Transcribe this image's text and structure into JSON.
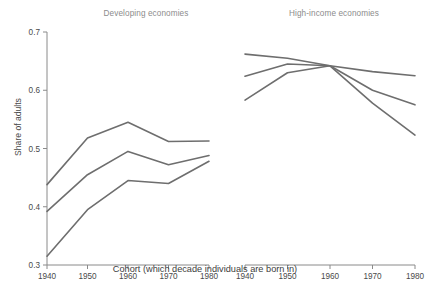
{
  "figure": {
    "supertitle": "",
    "ylabel": "Share of adults",
    "xlabel": "Cohort (which decade individuals are born in)",
    "line_color": "#6e6e6e",
    "axis_color": "#8a8a8a",
    "title_color": "#8c8c8c"
  },
  "chart_data": {
    "type": "line",
    "title": "",
    "xlabel": "Cohort (which decade individuals are born in)",
    "ylabel": "Share of adults",
    "x": [
      1940,
      1950,
      1960,
      1970,
      1980
    ],
    "xticklabels": [
      "1940",
      "1950",
      "1960",
      "1970",
      "1980"
    ],
    "yticks": [
      0.3,
      0.4,
      0.5,
      0.6,
      0.7
    ],
    "yticklabels": [
      "0.3",
      "0.4",
      "0.5",
      "0.6",
      "0.7"
    ],
    "ylim": [
      0.3,
      0.7
    ],
    "xlim": [
      1940,
      1980
    ],
    "grid": false,
    "legend": "none",
    "panels": [
      {
        "title": "Developing economies",
        "series": [
          {
            "name": "upper",
            "values": [
              0.438,
              0.518,
              0.545,
              0.512,
              0.513
            ]
          },
          {
            "name": "middle",
            "values": [
              0.392,
              0.455,
              0.495,
              0.472,
              0.488
            ]
          },
          {
            "name": "lower",
            "values": [
              0.315,
              0.395,
              0.445,
              0.44,
              0.478
            ]
          }
        ]
      },
      {
        "title": "High-income economies",
        "series": [
          {
            "name": "upper",
            "values": [
              0.662,
              0.655,
              0.642,
              0.632,
              0.625
            ]
          },
          {
            "name": "middle",
            "values": [
              0.624,
              0.645,
              0.642,
              0.6,
              0.575
            ]
          },
          {
            "name": "lower",
            "values": [
              0.583,
              0.63,
              0.642,
              0.578,
              0.523
            ]
          }
        ]
      }
    ]
  }
}
